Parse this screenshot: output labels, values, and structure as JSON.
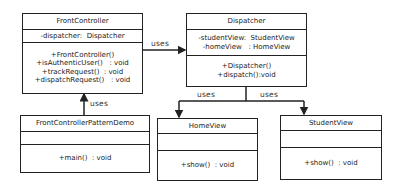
{
  "classes": {
    "front_controller": {
      "name": "FrontController",
      "attributes": [
        "-dispatcher:  Dispatcher"
      ],
      "methods": [
        "+FrontController()",
        "+isAuthenticUser()   : void",
        "+trackRequest()  : void",
        "+dispatchRequest()   : void"
      ]
    },
    "dispatcher": {
      "name": "Dispatcher",
      "attributes": [
        "-studentView:  StudentView",
        "-homeView   : HomeView"
      ],
      "methods": [
        "+Dispatcher()",
        "+dispatch():void"
      ]
    },
    "demo": {
      "name": "FrontControllerPatternDemo",
      "attributes": [],
      "methods": [
        "+main()  : void"
      ]
    },
    "home_view": {
      "name": "HomeView",
      "attributes": [],
      "methods": [
        "+show()  : void"
      ]
    },
    "student_view": {
      "name": "StudentView",
      "attributes": [],
      "methods": [
        "+show()  : void"
      ]
    }
  },
  "relations": {
    "fc_to_dispatcher": "uses",
    "demo_to_fc": "uses",
    "dispatcher_to_home": "uses",
    "dispatcher_to_student": "uses"
  }
}
